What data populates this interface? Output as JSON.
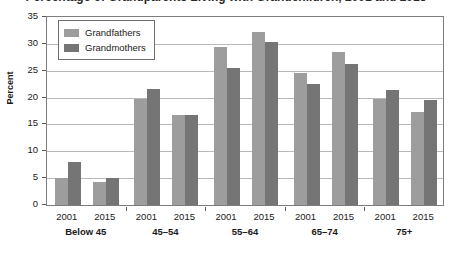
{
  "chart_data": {
    "type": "bar",
    "title": "Percentage of Grandparents Living with Grandchildren, 2001 and 2015",
    "xlabel": "",
    "ylabel": "Percent",
    "ylim": [
      0,
      35
    ],
    "ytick_step": 5,
    "yticks": [
      0,
      5,
      10,
      15,
      20,
      25,
      30,
      35
    ],
    "grid": true,
    "legend_position": "top-left",
    "categories": [
      "Below 45 2001",
      "Below 45 2015",
      "45–54 2001",
      "45–54 2015",
      "55–64 2001",
      "55–64 2015",
      "65–74 2001",
      "65–74 2015",
      "75+ 2001",
      "75+ 2015"
    ],
    "groups": [
      {
        "label": "Below 45",
        "years": [
          {
            "year": "2001",
            "grandfathers": 5.0,
            "grandmothers": 8.0
          },
          {
            "year": "2015",
            "grandfathers": 4.2,
            "grandmothers": 5.1
          }
        ]
      },
      {
        "label": "45–54",
        "years": [
          {
            "year": "2001",
            "grandfathers": 19.8,
            "grandmothers": 21.6
          },
          {
            "year": "2015",
            "grandfathers": 16.7,
            "grandmothers": 16.7
          }
        ]
      },
      {
        "label": "55–64",
        "years": [
          {
            "year": "2001",
            "grandfathers": 29.5,
            "grandmothers": 25.5
          },
          {
            "year": "2015",
            "grandfathers": 32.2,
            "grandmothers": 30.4
          }
        ]
      },
      {
        "label": "65–74",
        "years": [
          {
            "year": "2001",
            "grandfathers": 24.6,
            "grandmothers": 22.6
          },
          {
            "year": "2015",
            "grandfathers": 28.5,
            "grandmothers": 26.3
          }
        ]
      },
      {
        "label": "75+",
        "years": [
          {
            "year": "2001",
            "grandfathers": 19.8,
            "grandmothers": 21.5
          },
          {
            "year": "2015",
            "grandfathers": 17.3,
            "grandmothers": 19.6
          }
        ]
      }
    ],
    "series": [
      {
        "name": "Grandfathers",
        "color": "#9d9d9d",
        "values": [
          5.0,
          4.2,
          19.8,
          16.7,
          29.5,
          32.2,
          24.6,
          28.5,
          19.8,
          17.3
        ]
      },
      {
        "name": "Grandmothers",
        "color": "#757575",
        "values": [
          8.0,
          5.1,
          21.6,
          16.7,
          25.5,
          30.4,
          22.6,
          26.3,
          21.5,
          19.6
        ]
      }
    ]
  },
  "legend": {
    "items": [
      {
        "label": "Grandfathers"
      },
      {
        "label": "Grandmothers"
      }
    ]
  }
}
